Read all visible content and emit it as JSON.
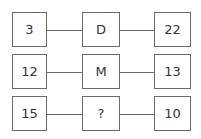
{
  "puzzle": {
    "rows": [
      {
        "left": "3",
        "middle": "D",
        "right": "22"
      },
      {
        "left": "12",
        "middle": "M",
        "right": "13"
      },
      {
        "left": "15",
        "middle": "?",
        "right": "10"
      }
    ]
  }
}
